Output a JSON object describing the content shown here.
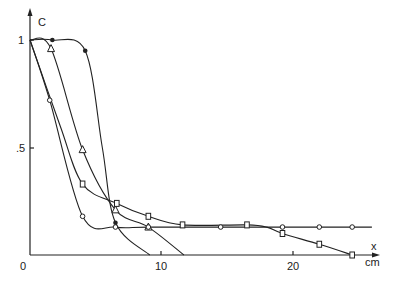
{
  "chart_data": {
    "type": "line",
    "title": "",
    "xlabel": "x",
    "xunit": "cm",
    "ylabel": "C",
    "xlim": [
      0,
      27
    ],
    "ylim": [
      0,
      1.05
    ],
    "x_ticks": [
      {
        "value": 0,
        "label": "0"
      },
      {
        "value": 10,
        "label": "10"
      },
      {
        "value": 20,
        "label": "20"
      }
    ],
    "y_ticks": [
      {
        "value": 0.5,
        "label": ".5"
      },
      {
        "value": 1,
        "label": "1"
      }
    ],
    "grid": false,
    "legend": null,
    "series": [
      {
        "name": "filled-circles",
        "marker": "filled-circle",
        "points": [
          [
            0,
            1.0
          ],
          [
            1.7,
            1.0
          ],
          [
            4.2,
            0.95
          ],
          [
            5.5,
            0.5
          ],
          [
            6.5,
            0.15
          ],
          [
            9.1,
            0.0
          ]
        ],
        "markers_at": [
          [
            1.7,
            1.0
          ],
          [
            4.2,
            0.95
          ],
          [
            6.5,
            0.15
          ]
        ]
      },
      {
        "name": "triangles",
        "marker": "open-triangle",
        "points": [
          [
            0,
            1.0
          ],
          [
            1.6,
            0.96
          ],
          [
            4.0,
            0.49
          ],
          [
            6.5,
            0.21
          ],
          [
            9.0,
            0.13
          ],
          [
            11.7,
            0.0
          ]
        ],
        "markers_at": [
          [
            1.6,
            0.96
          ],
          [
            4.0,
            0.49
          ],
          [
            6.5,
            0.21
          ],
          [
            9.0,
            0.13
          ]
        ]
      },
      {
        "name": "squares",
        "marker": "open-square",
        "points": [
          [
            0,
            1.0
          ],
          [
            2.3,
            0.6
          ],
          [
            4.0,
            0.33
          ],
          [
            6.6,
            0.24
          ],
          [
            9.0,
            0.18
          ],
          [
            11.6,
            0.14
          ],
          [
            16.5,
            0.14
          ],
          [
            18.0,
            0.13
          ],
          [
            19.2,
            0.1
          ],
          [
            22.0,
            0.05
          ],
          [
            24.5,
            0.0
          ]
        ],
        "markers_at": [
          [
            4.0,
            0.33
          ],
          [
            6.6,
            0.24
          ],
          [
            9.0,
            0.18
          ],
          [
            11.6,
            0.14
          ],
          [
            16.5,
            0.14
          ],
          [
            19.2,
            0.1
          ],
          [
            22.0,
            0.05
          ],
          [
            24.5,
            0.0
          ]
        ]
      },
      {
        "name": "open-circles",
        "marker": "open-circle",
        "points": [
          [
            0,
            1.0
          ],
          [
            1.5,
            0.72
          ],
          [
            4.0,
            0.18
          ],
          [
            6.5,
            0.13
          ],
          [
            9.0,
            0.13
          ],
          [
            14.5,
            0.13
          ],
          [
            19.2,
            0.13
          ],
          [
            22.0,
            0.13
          ],
          [
            24.5,
            0.13
          ],
          [
            26.0,
            0.13
          ]
        ],
        "markers_at": [
          [
            1.5,
            0.72
          ],
          [
            4.0,
            0.18
          ],
          [
            6.5,
            0.13
          ],
          [
            9.0,
            0.13
          ],
          [
            14.5,
            0.13
          ],
          [
            19.2,
            0.13
          ],
          [
            22.0,
            0.13
          ],
          [
            24.5,
            0.13
          ]
        ]
      }
    ]
  },
  "axes": {
    "y_label": "C",
    "x_label": "x",
    "x_unit": "cm",
    "origin_label": "0",
    "tick_10": "10",
    "tick_20": "20",
    "tick_half": ".5",
    "tick_one": "1"
  }
}
